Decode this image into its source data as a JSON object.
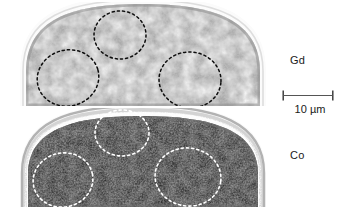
{
  "figure": {
    "type": "elemental-map-pair",
    "background_color": "#ffffff",
    "width": 351,
    "height": 209
  },
  "panels": [
    {
      "id": "gd",
      "element_label": "Gd",
      "description": "Bright speckled elemental distribution map of a hemispherical particle cross-section",
      "contrast": "bright",
      "base_gray": "#a8a8a8",
      "speckle_light": "#f0f0f0",
      "speckle_dark": "#707070",
      "rim_color": "#d8d8d8",
      "marker_color": "#101010",
      "markers": [
        {
          "cx": 102,
          "cy": 33,
          "rx": 26,
          "ry": 24,
          "rotate": 0
        },
        {
          "cx": 50,
          "cy": 76,
          "rx": 31,
          "ry": 28,
          "rotate": -15
        },
        {
          "cx": 172,
          "cy": 78,
          "rx": 31,
          "ry": 28,
          "rotate": 5
        }
      ]
    },
    {
      "id": "co",
      "element_label": "Co",
      "description": "Dark speckled elemental distribution map of the same hemispherical particle cross-section",
      "contrast": "dark",
      "base_gray": "#4a4a4a",
      "speckle_light": "#8a8a8a",
      "speckle_dark": "#141414",
      "rim_color": "#f4f4f4",
      "marker_color": "#ffffff",
      "markers": [
        {
          "cx": 104,
          "cy": 25,
          "rx": 27,
          "ry": 23,
          "rotate": 0
        },
        {
          "cx": 45,
          "cy": 72,
          "rx": 30,
          "ry": 27,
          "rotate": -12
        },
        {
          "cx": 170,
          "cy": 69,
          "rx": 33,
          "ry": 29,
          "rotate": 8
        }
      ]
    }
  ],
  "labels": {
    "gd": "Gd",
    "co": "Co"
  },
  "scale_bar": {
    "label": "10 µm",
    "length_px": 52,
    "value": 10,
    "unit": "µm",
    "color": "#333333"
  }
}
